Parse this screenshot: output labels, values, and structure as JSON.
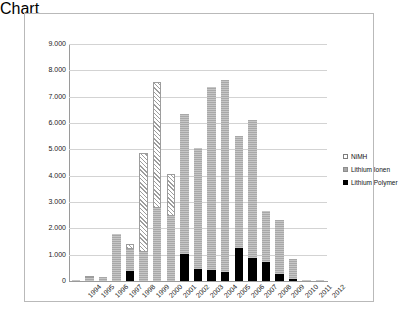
{
  "chart_data": {
    "type": "bar",
    "stacked": true,
    "title": "",
    "subtitle": "",
    "xlabel": "",
    "ylabel": "",
    "ylim": [
      0,
      9000
    ],
    "ytick_values": [
      0,
      1000,
      2000,
      3000,
      4000,
      5000,
      6000,
      7000,
      8000,
      9000
    ],
    "ytick_labels": [
      "0",
      "1.000",
      "2.000",
      "3.000",
      "4.000",
      "5.000",
      "6.000",
      "7.000",
      "8.000",
      "9.000"
    ],
    "grid": true,
    "legend_position": "right",
    "categories": [
      "1994",
      "1995",
      "1996",
      "1997",
      "1998",
      "1999",
      "2000",
      "2001",
      "2002",
      "2003",
      "2004",
      "2005",
      "2006",
      "2007",
      "2008",
      "2009",
      "2010",
      "2011",
      "2012"
    ],
    "series": [
      {
        "name": "Lithium Polymer",
        "color": "#000000",
        "values": [
          0,
          0,
          0,
          0,
          370,
          0,
          0,
          0,
          1030,
          470,
          420,
          330,
          1260,
          880,
          730,
          270,
          60,
          0,
          0
        ]
      },
      {
        "name": "Lithium Ionen",
        "color": "#a8a8a8",
        "values": [
          20,
          120,
          170,
          1780,
          830,
          1110,
          2780,
          2450,
          5300,
          4600,
          6960,
          7290,
          4240,
          5220,
          1930,
          2040,
          790,
          40,
          10
        ]
      },
      {
        "name": "NiMH",
        "color": "#ffffff",
        "values": [
          0,
          60,
          0,
          0,
          190,
          3760,
          4780,
          1620,
          0,
          0,
          0,
          0,
          0,
          0,
          0,
          0,
          0,
          0,
          0
        ]
      }
    ],
    "totals": [
      20,
      180,
      170,
      1780,
      1390,
      4870,
      7560,
      4070,
      6330,
      5070,
      7380,
      7620,
      5500,
      6100,
      2660,
      2310,
      850,
      40,
      10
    ]
  },
  "legend": {
    "items": [
      {
        "label": "NiMH",
        "marker": "nimh-marker"
      },
      {
        "label": "Lithium Ionen",
        "marker": "lithium-ionen-marker"
      },
      {
        "label": "Lithium Polymer",
        "marker": "lithium-polymer-marker"
      }
    ]
  }
}
